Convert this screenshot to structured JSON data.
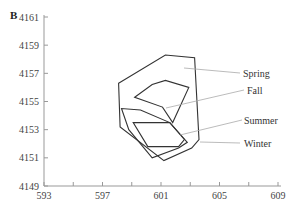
{
  "panel": {
    "label": "B"
  },
  "chart_data": {
    "type": "line",
    "title": "",
    "xlabel": "",
    "ylabel": "",
    "xlim": [
      593,
      609
    ],
    "ylim": [
      4149,
      4161
    ],
    "grid": false,
    "x_ticks": [
      593,
      595,
      597,
      599,
      601,
      603,
      605,
      607,
      609
    ],
    "x_tick_labels": [
      "593",
      "597",
      "601",
      "605",
      "609"
    ],
    "y_ticks": [
      4149,
      4151,
      4153,
      4155,
      4157,
      4159,
      4161
    ],
    "y_tick_labels": [
      "4149",
      "4151",
      "4153",
      "4155",
      "4157",
      "4159",
      "4161"
    ],
    "legend_position": "right, leader lines",
    "series": [
      {
        "name": "Spring",
        "shape": "polygon",
        "points": [
          [
            598.1,
            4156.3
          ],
          [
            601.3,
            4158.3
          ],
          [
            603.3,
            4158.1
          ],
          [
            603.6,
            4152.3
          ],
          [
            603.1,
            4151.7
          ],
          [
            601.2,
            4150.8
          ],
          [
            598.2,
            4153.2
          ]
        ],
        "label_pos": [
          243,
          77
        ],
        "leader": [
          [
            184,
            68
          ],
          [
            240,
            73
          ]
        ]
      },
      {
        "name": "Fall",
        "shape": "polygon",
        "points": [
          [
            599.2,
            4155.3
          ],
          [
            600.4,
            4156.2
          ],
          [
            601.3,
            4156.5
          ],
          [
            602.9,
            4156.0
          ],
          [
            601.8,
            4153.5
          ],
          [
            601.1,
            4154.6
          ]
        ],
        "label_pos": [
          247,
          94
        ],
        "leader": [
          [
            166,
            108
          ],
          [
            244,
            90
          ]
        ]
      },
      {
        "name": "Summer",
        "shape": "polygon",
        "points": [
          [
            599.1,
            4153.5
          ],
          [
            601.6,
            4153.5
          ],
          [
            602.6,
            4152.3
          ],
          [
            602.2,
            4151.8
          ],
          [
            600.1,
            4151.8
          ]
        ],
        "label_pos": [
          244,
          124
        ],
        "leader": [
          [
            180,
            135
          ],
          [
            242,
            120
          ]
        ]
      },
      {
        "name": "Winter",
        "shape": "polygon",
        "points": [
          [
            598.3,
            4154.5
          ],
          [
            598.8,
            4153.0
          ],
          [
            600.4,
            4151.0
          ],
          [
            602.2,
            4151.7
          ],
          [
            602.8,
            4152.1
          ],
          [
            601.6,
            4153.5
          ],
          [
            599.6,
            4154.4
          ]
        ],
        "label_pos": [
          244,
          147
        ],
        "leader": [
          [
            200,
            142
          ],
          [
            240,
            143
          ]
        ]
      }
    ]
  }
}
